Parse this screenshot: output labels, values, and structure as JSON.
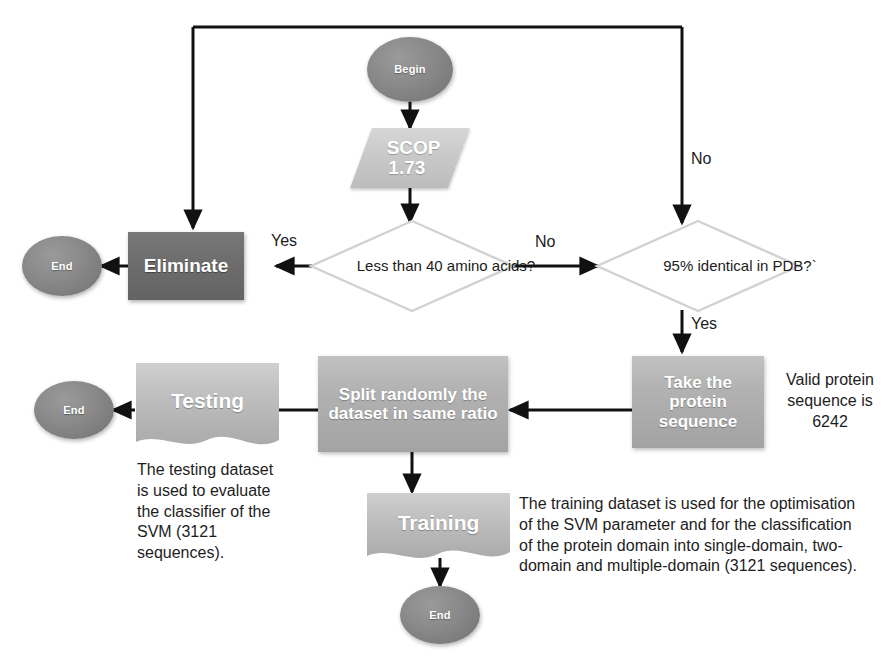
{
  "diagram": {
    "colors": {
      "background": "#ffffff",
      "line": "#111111",
      "terminator_fill": "#7c7c7c",
      "eliminate_fill": "#6d6d6d",
      "process_fill": "#b2b2b2",
      "data_fill": "#c9c9c9",
      "decision_stroke": "#d0d0d0",
      "text_dark": "#1b1b1b",
      "text_light": "#ffffff"
    },
    "nodes": {
      "begin": {
        "label": "Begin",
        "shape": "ellipse"
      },
      "scop": {
        "label_line1": "SCOP",
        "label_line2": "1.73",
        "shape": "parallelogram"
      },
      "decision_len": {
        "label": "Less than 40 amino acids?",
        "shape": "diamond"
      },
      "decision_pdb": {
        "label": "95% identical in PDB?`",
        "shape": "diamond"
      },
      "eliminate": {
        "label": "Eliminate",
        "shape": "process"
      },
      "end_left": {
        "label": "End",
        "shape": "ellipse"
      },
      "take_protein": {
        "label": "Take the protein sequence",
        "shape": "process"
      },
      "split": {
        "label": "Split randomly the dataset in same ratio",
        "shape": "process"
      },
      "testing": {
        "label": "Testing",
        "shape": "document"
      },
      "end_testing": {
        "label": "End",
        "shape": "ellipse"
      },
      "training": {
        "label": "Training",
        "shape": "document"
      },
      "end_training": {
        "label": "End",
        "shape": "ellipse"
      }
    },
    "edge_labels": {
      "yes_eliminate": "Yes",
      "no_to_pdb": "No",
      "no_top": "No",
      "yes_pdb": "Yes"
    },
    "annotations": {
      "valid_protein": "Valid protein sequence is 6242",
      "testing_note": "The testing dataset is used to evaluate the classifier of the SVM (3121 sequences).",
      "training_note": "The training dataset is used for the optimisation of the SVM parameter and for the classification of the protein domain into single-domain, two-domain and multiple-domain (3121 sequences)."
    }
  }
}
